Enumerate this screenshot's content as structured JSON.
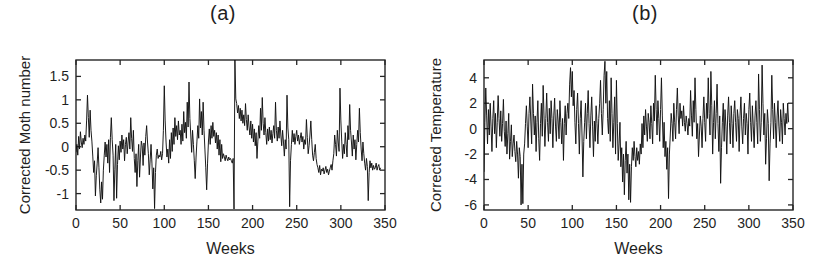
{
  "figure": {
    "panels": [
      {
        "id": "a",
        "tag": "(a)",
        "xlabel": "Weeks",
        "ylabel": "Corrected Moth number"
      },
      {
        "id": "b",
        "tag": "(b)",
        "xlabel": "Weeks",
        "ylabel": "Corrected Temperature"
      }
    ],
    "colors": {
      "trace": "#111111",
      "axis": "#252525",
      "background": "#ffffff",
      "text": "#1f1f1f"
    }
  },
  "chart_data": [
    {
      "type": "line",
      "panel": "a",
      "title": "(a)",
      "xlabel": "Weeks",
      "ylabel": "Corrected Moth number",
      "xlim": [
        0,
        350
      ],
      "ylim": [
        -1.35,
        1.85
      ],
      "xticks": [
        0,
        50,
        100,
        150,
        200,
        250,
        300,
        350
      ],
      "xticklabels": [
        "0",
        "50",
        "100",
        "150",
        "200",
        "250",
        "300",
        "350"
      ],
      "yticks": [
        1.5,
        1,
        0.5,
        0,
        -0.5,
        -1
      ],
      "yticklabels": [
        "1.5",
        "1",
        "0.5",
        "0",
        "-0.5",
        "-1"
      ],
      "grid": false,
      "legend": null,
      "x_start": 0,
      "x_step": 1,
      "values": [
        -0.12,
        0.05,
        -0.18,
        0.22,
        -0.05,
        0.32,
        0.1,
        -0.02,
        0.18,
        0.05,
        0.25,
        0.12,
        0.55,
        1.1,
        0.62,
        0.2,
        0.78,
        0.35,
        0.12,
        -0.2,
        -0.55,
        -0.3,
        -1.05,
        -0.62,
        -0.35,
        -0.02,
        -0.45,
        -0.92,
        -1.2,
        -0.75,
        -1.12,
        -0.5,
        -0.18,
        0.1,
        -0.22,
        0.05,
        -0.35,
        0.15,
        -0.55,
        0.2,
        0.62,
        0.15,
        -0.18,
        -1.15,
        -0.48,
        0.05,
        -1.1,
        -0.38,
        0.02,
        -0.28,
        0.12,
        -0.12,
        0.25,
        -0.05,
        0.15,
        -0.3,
        0.05,
        0.2,
        -0.15,
        0.1,
        0.3,
        -0.05,
        0.62,
        0.18,
        -0.1,
        0.35,
        -0.25,
        -0.55,
        -0.15,
        -0.85,
        -0.3,
        0.05,
        -0.65,
        -0.22,
        0.12,
        0.02,
        -0.4,
        0.08,
        -0.18,
        0.22,
        0.45,
        0.1,
        -0.15,
        -0.6,
        -0.28,
        0.05,
        -0.35,
        -0.9,
        -0.45,
        -1.32,
        -0.55,
        -0.18,
        -0.05,
        -0.25,
        -0.18,
        -0.22,
        -0.1,
        -0.28,
        -0.15,
        0.35,
        1.3,
        0.55,
        0.1,
        -0.22,
        -0.05,
        -0.35,
        0.15,
        -0.25,
        0.3,
        -0.1,
        0.4,
        0.05,
        0.62,
        0.22,
        0.45,
        0.15,
        0.55,
        0.25,
        0.35,
        0.05,
        0.48,
        0.12,
        0.75,
        0.3,
        0.52,
        0.18,
        0.95,
        0.42,
        1.38,
        0.6,
        0.25,
        -0.12,
        0.35,
        0.05,
        -0.3,
        -0.68,
        -0.22,
        0.12,
        0.45,
        0.18,
        1.02,
        0.4,
        0.75,
        0.25,
        0.95,
        0.35,
        -0.05,
        -0.45,
        -0.92,
        -0.35,
        0.1,
        0.38,
        0.05,
        0.45,
        0.18,
        0.52,
        0.22,
        0.35,
        0.08,
        0.3,
        -0.05,
        0.25,
        -0.18,
        0.15,
        -0.32,
        0.05,
        -0.25,
        -0.15,
        -0.22,
        -0.3,
        -0.18,
        -0.25,
        -0.3,
        -0.22,
        -0.28,
        -0.25,
        -0.3,
        -0.35,
        -0.25,
        -1.33,
        1.85,
        1.02,
        0.92,
        0.72,
        0.88,
        0.6,
        0.82,
        0.55,
        0.78,
        0.5,
        0.68,
        0.45,
        0.92,
        0.58,
        0.35,
        0.68,
        0.42,
        0.25,
        0.55,
        0.18,
        0.48,
        0.1,
        0.38,
        0.02,
        0.3,
        -0.25,
        0.12,
        0.45,
        0.18,
        0.82,
        0.35,
        1.05,
        0.5,
        0.25,
        0.62,
        0.3,
        0.05,
        0.38,
        0.12,
        0.42,
        0.15,
        0.35,
        0.08,
        0.28,
        0.45,
        0.18,
        0.95,
        0.35,
        0.12,
        0.42,
        0.18,
        0.55,
        0.25,
        0.02,
        0.35,
        0.1,
        -0.2,
        0.15,
        -0.05,
        1.1,
        0.4,
        0.15,
        -1.28,
        -0.3,
        0.05,
        0.35,
        0.1,
        0.28,
        0.05,
        0.22,
        0.35,
        0.12,
        0.25,
        0.05,
        0.18,
        0.3,
        0.1,
        0.22,
        -0.05,
        0.15,
        0.05,
        0.58,
        0.2,
        -0.15,
        0.02,
        0.25,
        0.55,
        0.15,
        -0.18,
        -0.3,
        -0.12,
        0.05,
        -0.25,
        -0.38,
        -0.45,
        -0.55,
        -0.4,
        -0.6,
        -0.48,
        -0.52,
        -0.45,
        -0.58,
        -0.5,
        -0.42,
        -0.55,
        -0.48,
        -0.6,
        -0.52,
        -0.45,
        -0.38,
        -0.5,
        -0.3,
        -0.15,
        0.25,
        0.05,
        -0.2,
        0.35,
        0.1,
        -0.1,
        1.25,
        0.55,
        0.12,
        -0.25,
        0.05,
        -0.15,
        0.3,
        0.05,
        -0.22,
        0.45,
        0.15,
        0.9,
        0.35,
        0.1,
        -0.2,
        0.25,
        -0.05,
        0.15,
        -0.28,
        0.05,
        0.35,
        0.1,
        0.82,
        0.3,
        -0.05,
        -0.3,
        0.1,
        -0.15,
        -0.35,
        -0.5,
        -0.25,
        -0.42,
        -1.15,
        -0.55,
        -0.3,
        -0.45,
        -0.35,
        -0.5,
        -0.4,
        -0.48,
        -0.45,
        -0.35,
        -0.5,
        -0.42,
        -0.38,
        -0.5,
        -0.45
      ]
    },
    {
      "type": "line",
      "panel": "b",
      "title": "(b)",
      "xlabel": "Weeks",
      "ylabel": "Corrected Temperature",
      "xlim": [
        0,
        350
      ],
      "ylim": [
        -6.4,
        5.4
      ],
      "xticks": [
        0,
        50,
        100,
        150,
        200,
        250,
        300,
        350
      ],
      "xticklabels": [
        "0",
        "50",
        "100",
        "150",
        "200",
        "250",
        "300",
        "350"
      ],
      "yticks": [
        4,
        2,
        0,
        -2,
        -4,
        -6
      ],
      "yticklabels": [
        "4",
        "2",
        "0",
        "-2",
        "-4",
        "-6"
      ],
      "grid": false,
      "legend": null,
      "x_start": 0,
      "x_step": 1,
      "values": [
        -3.4,
        0.5,
        3.2,
        1.0,
        -1.2,
        1.5,
        -0.5,
        2.0,
        0.2,
        -1.8,
        0.8,
        2.2,
        -0.4,
        1.2,
        -1.5,
        0.5,
        2.6,
        0.8,
        -0.6,
        1.4,
        -1.0,
        0.4,
        2.3,
        -0.2,
        -1.4,
        0.6,
        -2.0,
        -0.4,
        1.2,
        -2.4,
        -1.0,
        0.3,
        -2.2,
        -1.2,
        -0.5,
        -1.8,
        -2.6,
        -1.0,
        -2.0,
        -3.9,
        -1.5,
        -2.2,
        -6.0,
        -2.8,
        -5.9,
        -2.0,
        -1.2,
        0.4,
        1.8,
        0.2,
        -1.5,
        1.2,
        2.5,
        0.6,
        -1.2,
        3.5,
        1.2,
        -0.5,
        1.0,
        -1.8,
        0.5,
        2.2,
        -0.8,
        -2.5,
        0.4,
        2.0,
        -0.6,
        3.4,
        1.0,
        -1.4,
        0.8,
        2.8,
        0.5,
        -1.0,
        1.6,
        -0.4,
        2.2,
        0.8,
        -1.5,
        1.0,
        2.4,
        0.2,
        -1.0,
        1.5,
        0.6,
        -0.8,
        2.2,
        0.5,
        -1.2,
        0.8,
        -2.5,
        0.4,
        1.8,
        -0.5,
        1.2,
        2.0,
        0.8,
        3.5,
        4.8,
        2.5,
        4.5,
        1.8,
        3.0,
        0.5,
        -1.2,
        1.5,
        2.8,
        0.4,
        -2.0,
        0.8,
        2.2,
        -0.5,
        -3.8,
        -1.0,
        0.5,
        2.0,
        -0.8,
        1.2,
        3.0,
        0.4,
        -1.5,
        1.0,
        2.5,
        0.2,
        -2.2,
        0.6,
        -1.0,
        1.8,
        0.4,
        -1.2,
        0.8,
        2.0,
        3.8,
        1.2,
        -0.5,
        1.5,
        4.2,
        5.3,
        2.0,
        4.5,
        0.8,
        -0.4,
        2.2,
        -1.0,
        4.0,
        1.2,
        -1.5,
        0.5,
        2.5,
        -2.0,
        3.8,
        0.4,
        -2.5,
        -1.2,
        0.5,
        -3.0,
        -1.5,
        -4.2,
        -2.0,
        -5.2,
        -2.5,
        -1.0,
        -3.5,
        -2.0,
        -5.6,
        -2.8,
        -5.8,
        -3.0,
        -1.5,
        -2.5,
        -1.0,
        -2.2,
        -3.0,
        -1.5,
        -2.5,
        -1.8,
        -2.8,
        -1.2,
        -2.0,
        0.4,
        -1.5,
        1.0,
        -0.5,
        1.5,
        0.2,
        -1.0,
        1.2,
        0.5,
        -0.8,
        1.8,
        0.4,
        -1.2,
        2.0,
        0.6,
        4.2,
        1.5,
        -0.5,
        2.2,
        0.8,
        -1.0,
        1.5,
        4.0,
        1.0,
        -1.5,
        0.5,
        -2.2,
        -1.0,
        -3.2,
        -1.5,
        -5.5,
        -2.0,
        -0.5,
        1.2,
        0.4,
        -1.0,
        2.0,
        0.5,
        -0.8,
        1.5,
        3.2,
        1.0,
        -0.4,
        2.0,
        0.8,
        1.4,
        0.2,
        1.8,
        0.5,
        -0.2,
        1.0,
        0.4,
        -0.5,
        0.8,
        0.2,
        3.0,
        1.0,
        -0.6,
        2.2,
        0.5,
        4.0,
        1.5,
        -0.8,
        0.4,
        -2.2,
        -0.5,
        1.0,
        0.2,
        -1.5,
        0.8,
        2.5,
        0.5,
        -1.0,
        2.0,
        0.8,
        4.0,
        1.2,
        -0.5,
        4.5,
        1.8,
        -2.0,
        0.5,
        2.2,
        -0.8,
        1.2,
        3.5,
        0.4,
        -1.8,
        1.0,
        -4.3,
        -1.5,
        0.5,
        2.0,
        -1.0,
        1.5,
        0.2,
        -2.0,
        1.0,
        2.5,
        0.5,
        -1.2,
        1.8,
        0.4,
        -1.5,
        1.2,
        2.2,
        0.5,
        -1.0,
        1.5,
        0.8,
        -1.8,
        1.0,
        2.5,
        0.2,
        -1.2,
        0.8,
        2.0,
        -0.5,
        1.2,
        0.4,
        -2.0,
        1.5,
        2.8,
        0.5,
        -1.0,
        1.8,
        0.2,
        -1.5,
        1.0,
        2.2,
        0.5,
        -1.2,
        4.3,
        1.5,
        -1.0,
        0.5,
        5.0,
        2.0,
        -0.5,
        1.2,
        -2.8,
        -0.8,
        1.5,
        0.4,
        -4.1,
        -1.2,
        0.5,
        4.2,
        1.5,
        -0.8,
        2.0,
        0.5,
        -1.5,
        1.0,
        2.2,
        0.2,
        -1.0,
        1.5,
        0.5,
        -1.2,
        2.0,
        0.8,
        -0.5,
        1.2,
        0.4,
        2.0,
        0.5
      ]
    }
  ]
}
